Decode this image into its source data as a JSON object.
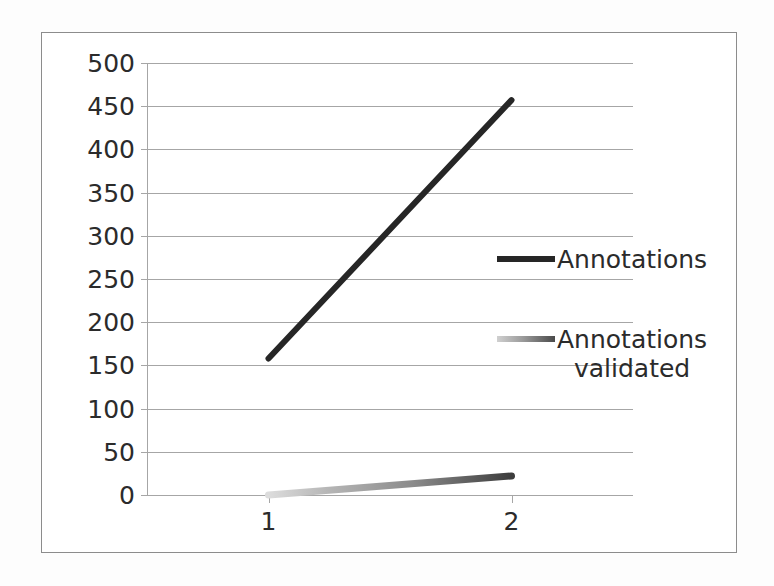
{
  "chart_data": {
    "type": "line",
    "title": "",
    "xlabel": "",
    "ylabel": "",
    "categories": [
      "1",
      "2"
    ],
    "x": [
      1,
      2
    ],
    "ylim": [
      0,
      500
    ],
    "xlim": [
      0.5,
      2.5
    ],
    "y_ticks": [
      0,
      50,
      100,
      150,
      200,
      250,
      300,
      350,
      400,
      450,
      500
    ],
    "y_tick_labels": [
      "0",
      "50",
      "100",
      "150",
      "200",
      "250",
      "300",
      "350",
      "400",
      "450",
      "500"
    ],
    "x_tick_labels": [
      "1",
      "2"
    ],
    "grid": "horizontal",
    "legend_position": "inside-right",
    "series": [
      {
        "name": "Annotations",
        "values": [
          158,
          457
        ],
        "color": "#262626",
        "style": "solid-thick"
      },
      {
        "name": "Annotations\nvalidated",
        "values": [
          0,
          22
        ],
        "color": "#8a8a8a",
        "style": "gradient-thick"
      }
    ]
  },
  "legend": {
    "entries": [
      {
        "label": "Annotations"
      },
      {
        "label": "Annotations\nvalidated"
      }
    ]
  },
  "colors": {
    "series_annotations": "#262626",
    "series_annotations_validated": "#8a8a8a",
    "gridline": "#a6a6a6",
    "frame_border": "#8c8c8c",
    "text": "#2b2b2b",
    "background": "#ffffff"
  }
}
